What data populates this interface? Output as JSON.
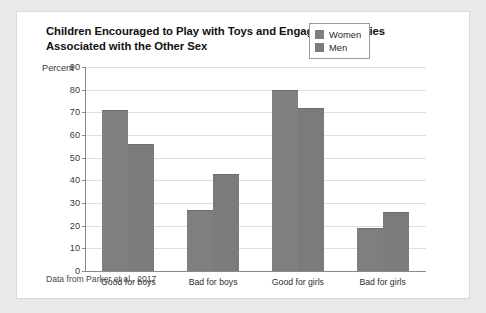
{
  "card": {
    "title": "Children Encouraged to Play with Toys and Engage in Activities Associated with the Other Sex",
    "source": "Data from Parker et al., 2017"
  },
  "chart_data": {
    "type": "bar",
    "title": "Children Encouraged to Play with Toys and Engage in Activities Associated with the Other Sex",
    "categories": [
      "Good for boys",
      "Bad for boys",
      "Good for girls",
      "Bad for girls"
    ],
    "series": [
      {
        "name": "Women",
        "values": [
          71,
          27,
          80,
          19
        ]
      },
      {
        "name": "Men",
        "values": [
          56,
          43,
          72,
          26
        ]
      }
    ],
    "xlabel": "",
    "ylabel": "Percent",
    "ylim": [
      0,
      90
    ],
    "yticks": [
      0,
      10,
      20,
      30,
      40,
      50,
      60,
      70,
      80,
      90
    ],
    "ytick_labels": [
      "0",
      "10",
      "20",
      "30",
      "40",
      "50",
      "60",
      "70",
      "80",
      "90"
    ],
    "grid": true,
    "legend_position": "top-right",
    "colors": {
      "women": "#7f7f7f",
      "men": "#7b7b7b"
    }
  }
}
